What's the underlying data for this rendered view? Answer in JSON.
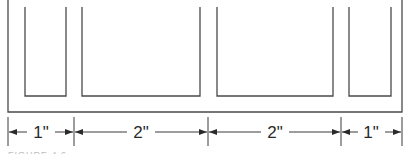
{
  "drawing": {
    "line_color": "#4a4a4a",
    "slots": [
      {
        "label": "slot-1",
        "width_in": 1
      },
      {
        "label": "slot-2",
        "width_in": 2
      },
      {
        "label": "slot-3",
        "width_in": 2
      },
      {
        "label": "slot-4",
        "width_in": 1
      }
    ],
    "dimensions": [
      {
        "label": "1\"",
        "from_x": 8,
        "to_x": 74
      },
      {
        "label": "2\"",
        "from_x": 74,
        "to_x": 208
      },
      {
        "label": "2\"",
        "from_x": 208,
        "to_x": 341
      },
      {
        "label": "1\"",
        "from_x": 341,
        "to_x": 402
      }
    ],
    "caption": "FIGURE 4.6"
  }
}
